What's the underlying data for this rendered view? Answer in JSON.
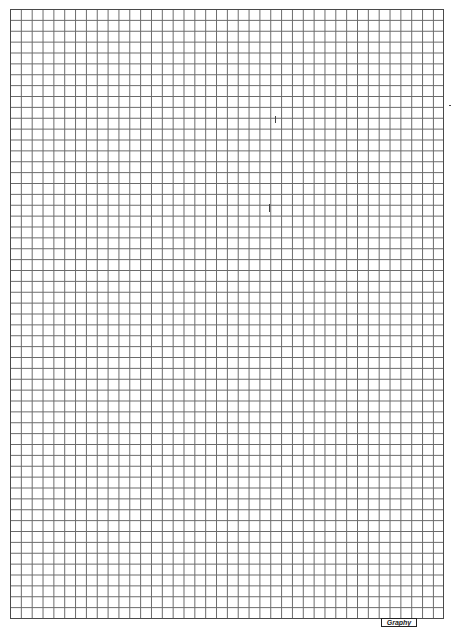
{
  "sheet": {
    "type": "graph-paper",
    "columns": 40,
    "rows": 56,
    "line_color": "#6a6a6a",
    "border_color": "#4a4a4a",
    "background": "#ffffff"
  },
  "logo": {
    "text": "Graphy"
  }
}
